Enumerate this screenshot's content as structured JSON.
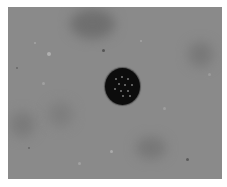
{
  "image": {
    "description": "Grayscale microscopy field with a single dark spherical object containing small light granules",
    "background_color": "#8a8a8a",
    "object_color": "#0c0c0c",
    "granule_color": "#7a7a7a"
  }
}
